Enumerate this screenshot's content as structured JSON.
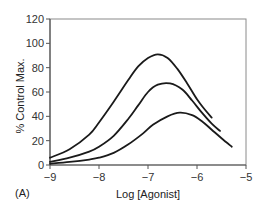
{
  "chart_data": {
    "type": "line",
    "title": "",
    "panel_label": "(A)",
    "xlabel": "Log [Agonist]",
    "ylabel": "% Control Max.",
    "xlim": [
      -9,
      -5
    ],
    "ylim": [
      0,
      120
    ],
    "xticks": [
      -9,
      -8,
      -7,
      -6,
      -5
    ],
    "xtick_labels": [
      "−9",
      "−8",
      "−7",
      "−6",
      "−5"
    ],
    "yticks": [
      0,
      20,
      40,
      60,
      80,
      100,
      120
    ],
    "ytick_labels": [
      "0",
      "20",
      "40",
      "60",
      "80",
      "100",
      "120"
    ],
    "grid": false,
    "legend": null,
    "line_color": "#1a1a1a",
    "series": [
      {
        "name": "curve-1",
        "x": [
          -9.0,
          -8.6,
          -8.2,
          -8.0,
          -7.7,
          -7.4,
          -7.2,
          -7.0,
          -6.8,
          -6.6,
          -6.4,
          -6.2,
          -6.0,
          -5.85,
          -5.7
        ],
        "y": [
          6,
          13,
          25,
          35,
          52,
          70,
          81,
          88,
          91,
          88,
          79,
          67,
          54,
          46,
          39
        ]
      },
      {
        "name": "curve-2",
        "x": [
          -9.0,
          -8.6,
          -8.2,
          -8.0,
          -7.7,
          -7.4,
          -7.2,
          -7.0,
          -6.8,
          -6.55,
          -6.3,
          -6.1,
          -5.9,
          -5.7,
          -5.53
        ],
        "y": [
          2.5,
          6,
          11,
          15,
          24,
          38,
          49,
          60,
          66,
          67,
          62,
          53,
          43,
          34,
          28
        ]
      },
      {
        "name": "curve-3",
        "x": [
          -9.0,
          -8.6,
          -8.2,
          -8.0,
          -7.7,
          -7.4,
          -7.1,
          -6.9,
          -6.6,
          -6.35,
          -6.1,
          -5.9,
          -5.7,
          -5.5,
          -5.29
        ],
        "y": [
          1,
          2.5,
          4.5,
          6,
          10,
          17,
          26,
          33,
          40,
          43,
          41,
          36,
          29,
          22,
          15
        ]
      }
    ]
  }
}
